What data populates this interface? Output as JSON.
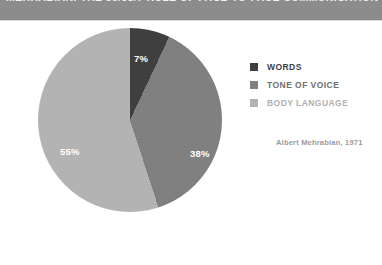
{
  "banner": {
    "title": "MEHRABIAN: THE 55/38/7 RULE OF FACE-TO-FACE COMMUNICATION",
    "background_color": "#8c8c8c",
    "text_color": "#f2f2f2"
  },
  "legend": {
    "position": "right",
    "items": [
      {
        "label": "WORDS",
        "color": "#3f3f3f",
        "text_color": "#3f3f3f"
      },
      {
        "label": "TONE OF VOICE",
        "color": "#808080",
        "text_color": "#6e6e6e"
      },
      {
        "label": "BODY LANGUAGE",
        "color": "#b3b3b3",
        "text_color": "#b0b0b0"
      }
    ]
  },
  "attribution": "Albert Mehrabian, 1971",
  "labels": {
    "words": "7%",
    "tone": "38%",
    "body": "55%"
  },
  "chart_data": {
    "type": "pie",
    "title": "MEHRABIAN: THE 55/38/7 RULE OF FACE-TO-FACE COMMUNICATION",
    "categories": [
      "WORDS",
      "TONE OF VOICE",
      "BODY LANGUAGE"
    ],
    "values": [
      7,
      38,
      55
    ],
    "unit": "%",
    "data_labels": [
      "7%",
      "38%",
      "55%"
    ],
    "colors": [
      "#3f3f3f",
      "#808080",
      "#b3b3b3"
    ],
    "start_angle_deg": 0,
    "direction": "clockwise",
    "legend": "right",
    "annotation": "Albert Mehrabian, 1971",
    "xlabel": "",
    "ylabel": "",
    "grid": false
  }
}
